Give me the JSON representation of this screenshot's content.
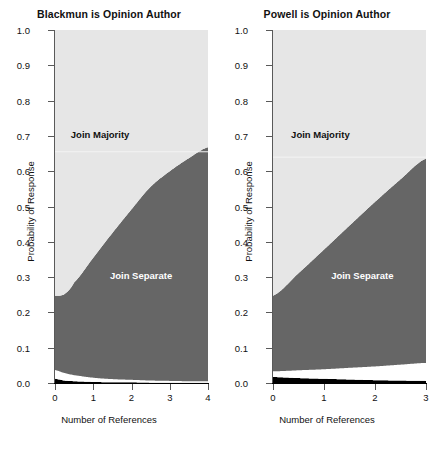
{
  "figure": {
    "width": 436,
    "height": 451,
    "background": "#ffffff"
  },
  "colors": {
    "join_majority_fill": "#E6E6E6",
    "join_separate_fill": "#666666",
    "dissent_fill": "#FFFFFF",
    "other_fill": "#000000",
    "axis": "#595959",
    "text": "#111111"
  },
  "chart_data": [
    {
      "type": "area",
      "title": "Blackmun is Opinion Author",
      "xlabel": "Number of References",
      "ylabel": "Probability of Response",
      "xlim": [
        0,
        4
      ],
      "ylim": [
        0,
        1
      ],
      "xticks": [
        0,
        1,
        2,
        3,
        4
      ],
      "xticklabels": [
        "0",
        "1",
        "2",
        "3",
        "4"
      ],
      "yticks": [
        0.0,
        0.1,
        0.2,
        0.3,
        0.4,
        0.5,
        0.6,
        0.7,
        0.8,
        0.9,
        1.0
      ],
      "yticklabels": [
        "0.0",
        "0.1",
        "0.2",
        "0.3",
        "0.4",
        "0.5",
        "0.6",
        "0.7",
        "0.8",
        "0.9",
        "1.0"
      ],
      "grid": false,
      "legend": "inline-annotations",
      "stacking": "cumulative-from-bottom",
      "x": [
        0,
        0.25,
        0.5,
        1,
        1.5,
        2,
        2.5,
        3,
        3.5,
        4
      ],
      "series": [
        {
          "name": "Other",
          "color": "#000000",
          "cumulative_top": [
            0.012,
            0.007,
            0.005,
            0.003,
            0.002,
            0.002,
            0.001,
            0.001,
            0.001,
            0.001
          ]
        },
        {
          "name": "Dissent",
          "color": "#FFFFFF",
          "cumulative_top": [
            0.037,
            0.028,
            0.022,
            0.015,
            0.011,
            0.009,
            0.007,
            0.006,
            0.005,
            0.005
          ]
        },
        {
          "name": "Join Separate",
          "color": "#666666",
          "cumulative_top": [
            0.247,
            0.252,
            0.285,
            0.355,
            0.425,
            0.492,
            0.556,
            0.6,
            0.637,
            0.668
          ]
        },
        {
          "name": "Join Majority",
          "color": "#E6E6E6",
          "cumulative_top": [
            1.0,
            1.0,
            1.0,
            1.0,
            1.0,
            1.0,
            1.0,
            1.0,
            1.0,
            1.0
          ]
        }
      ],
      "annotations": [
        {
          "text": "Join Majority",
          "x": 1.18,
          "y": 0.705,
          "on": "light"
        },
        {
          "text": "Join Separate",
          "x": 2.25,
          "y": 0.305,
          "on": "dark"
        }
      ],
      "faint_line_y": 0.655
    },
    {
      "type": "area",
      "title": "Powell is Opinion Author",
      "xlabel": "Number of References",
      "ylabel": "Probability of Response",
      "xlim": [
        0,
        3
      ],
      "ylim": [
        0,
        1
      ],
      "xticks": [
        0,
        1,
        2,
        3
      ],
      "xticklabels": [
        "0",
        "1",
        "2",
        "3"
      ],
      "yticks": [
        0.0,
        0.1,
        0.2,
        0.3,
        0.4,
        0.5,
        0.6,
        0.7,
        0.8,
        0.9,
        1.0
      ],
      "yticklabels": [
        "0.0",
        "0.1",
        "0.2",
        "0.3",
        "0.4",
        "0.5",
        "0.6",
        "0.7",
        "0.8",
        "0.9",
        "1.0"
      ],
      "grid": false,
      "legend": "inline-annotations",
      "stacking": "cumulative-from-bottom",
      "x": [
        0,
        0.5,
        1,
        1.5,
        2,
        2.5,
        3
      ],
      "series": [
        {
          "name": "Other",
          "color": "#000000",
          "cumulative_top": [
            0.017,
            0.014,
            0.012,
            0.01,
            0.008,
            0.007,
            0.006
          ]
        },
        {
          "name": "Dissent",
          "color": "#FFFFFF",
          "cumulative_top": [
            0.033,
            0.036,
            0.039,
            0.043,
            0.047,
            0.052,
            0.057
          ]
        },
        {
          "name": "Join Separate",
          "color": "#666666",
          "cumulative_top": [
            0.247,
            0.311,
            0.378,
            0.446,
            0.513,
            0.577,
            0.636
          ]
        },
        {
          "name": "Join Majority",
          "color": "#E6E6E6",
          "cumulative_top": [
            1.0,
            1.0,
            1.0,
            1.0,
            1.0,
            1.0,
            1.0
          ]
        }
      ],
      "annotations": [
        {
          "text": "Join Majority",
          "x": 0.93,
          "y": 0.705,
          "on": "light"
        },
        {
          "text": "Join Separate",
          "x": 1.75,
          "y": 0.305,
          "on": "dark"
        }
      ],
      "faint_line_y": 0.64
    }
  ]
}
